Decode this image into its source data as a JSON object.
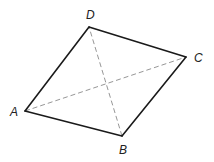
{
  "figure": {
    "type": "quadrilateral",
    "vertices": {
      "A": {
        "label": "A",
        "x": 25,
        "y": 111
      },
      "B": {
        "label": "B",
        "x": 122,
        "y": 136
      },
      "C": {
        "label": "C",
        "x": 186,
        "y": 57
      },
      "D": {
        "label": "D",
        "x": 89,
        "y": 27
      }
    },
    "labels": {
      "A": {
        "text": "A",
        "x": 10,
        "y": 116
      },
      "B": {
        "text": "B",
        "x": 119,
        "y": 154
      },
      "C": {
        "text": "C",
        "x": 194,
        "y": 62
      },
      "D": {
        "text": "D",
        "x": 86,
        "y": 19
      }
    },
    "sides": [
      {
        "name": "AB",
        "from": "A",
        "to": "B",
        "style": "solid"
      },
      {
        "name": "BC",
        "from": "B",
        "to": "C",
        "style": "solid"
      },
      {
        "name": "CD",
        "from": "C",
        "to": "D",
        "style": "solid"
      },
      {
        "name": "DA",
        "from": "D",
        "to": "A",
        "style": "solid"
      }
    ],
    "diagonals": [
      {
        "name": "AC",
        "from": "A",
        "to": "C",
        "style": "dashed"
      },
      {
        "name": "BD",
        "from": "B",
        "to": "D",
        "style": "dashed"
      }
    ],
    "colors": {
      "side": "#1a1a1a",
      "diagonal": "#8a8a8a",
      "label": "#222222",
      "background": "#ffffff"
    }
  }
}
